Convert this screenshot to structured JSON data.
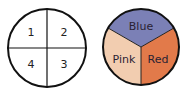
{
  "left_spinner": {
    "sections": [
      {
        "label": "1",
        "position": "top-left"
      },
      {
        "label": "2",
        "position": "top-right"
      },
      {
        "label": "3",
        "position": "bottom-right"
      },
      {
        "label": "4",
        "position": "bottom-left"
      }
    ]
  },
  "right_spinner": {
    "sections": [
      {
        "label": "Blue",
        "color": "#7b80b6"
      },
      {
        "label": "Red",
        "color": "#e27a4a"
      },
      {
        "label": "Pink",
        "color": "#f2cdb0"
      }
    ]
  }
}
